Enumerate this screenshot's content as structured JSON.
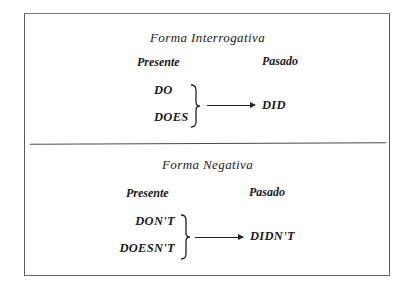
{
  "sections": [
    {
      "title": "Forma Interrogativa",
      "col_present": "Presente",
      "col_past": "Pasado",
      "present_forms": [
        "DO",
        "DOES"
      ],
      "past_form": "DID"
    },
    {
      "title": "Forma Negativa",
      "col_present": "Presente",
      "col_past": "Pasado",
      "present_forms": [
        "DON'T",
        "DOESN'T"
      ],
      "past_form": "DIDN'T"
    }
  ]
}
